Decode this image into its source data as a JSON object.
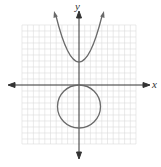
{
  "diagram": {
    "type": "coordinate-graph",
    "axes": {
      "x_label": "x",
      "y_label": "y"
    },
    "grid": {
      "cells_x": 20,
      "cells_y": 20,
      "color": "#d8d8d8"
    },
    "curves": [
      {
        "name": "parabola",
        "description": "upward-opening parabola with vertex on positive y-axis",
        "vertex": [
          0,
          4
        ]
      },
      {
        "name": "circle",
        "description": "circle centered on negative y-axis tangent to x-axis",
        "center": [
          0,
          -4
        ],
        "radius": 4
      }
    ],
    "colors": {
      "curve": "#666666",
      "axis": "#333333"
    }
  }
}
